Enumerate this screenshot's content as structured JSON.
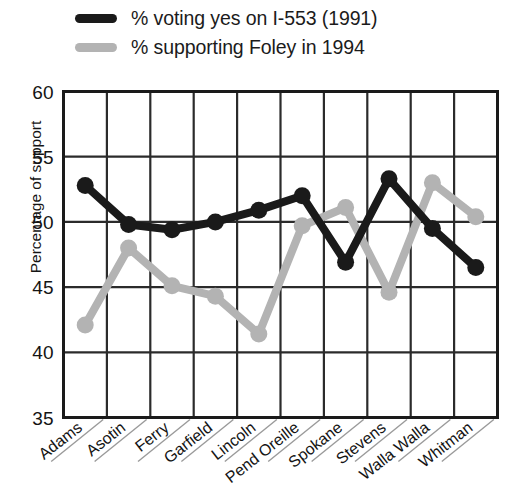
{
  "legend": {
    "items": [
      {
        "label": "% voting yes on I-553 (1991)",
        "color": "#1a1a1a",
        "name": "series-i553"
      },
      {
        "label": "% supporting Foley in 1994",
        "color": "#b3b3b3",
        "name": "series-foley"
      }
    ]
  },
  "axes": {
    "ylabel": "Percentage of support",
    "yticks": [
      "35",
      "40",
      "45",
      "50",
      "55",
      "60"
    ],
    "xlabel": ""
  },
  "chart_data": {
    "type": "line",
    "title": "",
    "xlabel": "",
    "ylabel": "Percentage of support",
    "ylim": [
      35,
      60
    ],
    "yticks": [
      35,
      40,
      45,
      50,
      55,
      60
    ],
    "grid": true,
    "legend_position": "top-left",
    "categories": [
      "Adams",
      "Asotin",
      "Ferry",
      "Garfield",
      "Lincoln",
      "Pend Oreille",
      "Spokane",
      "Stevens",
      "Walla Walla",
      "Whitman"
    ],
    "series": [
      {
        "name": "% voting yes on I-553 (1991)",
        "color": "#1a1a1a",
        "values": [
          52.8,
          49.8,
          49.4,
          50.0,
          50.9,
          52.0,
          46.9,
          53.3,
          49.5,
          46.5
        ]
      },
      {
        "name": "% supporting Foley in 1994",
        "color": "#b3b3b3",
        "values": [
          42.1,
          48.0,
          45.1,
          44.3,
          41.4,
          49.7,
          51.1,
          44.6,
          53.0,
          50.4
        ]
      }
    ]
  }
}
